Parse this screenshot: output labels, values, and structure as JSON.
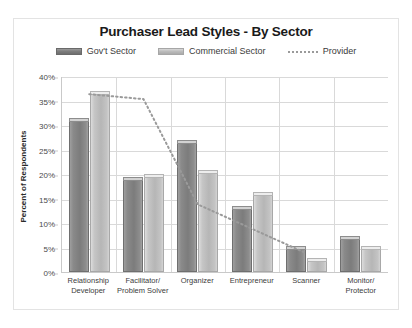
{
  "chart_data": {
    "type": "bar",
    "title": "Purchaser Lead Styles - By Sector",
    "xlabel": "",
    "ylabel": "Percent of Respondents",
    "ylim": [
      0,
      40
    ],
    "ytick_labels": [
      "40%",
      "35%",
      "30%",
      "25%",
      "20%",
      "15%",
      "10%",
      "5%",
      "0%"
    ],
    "ytick_values": [
      40,
      35,
      30,
      25,
      20,
      15,
      10,
      5,
      0
    ],
    "grid": true,
    "legend_position": "top-center",
    "categories": [
      "Relationship Developer",
      "Facilitator/ Problem Solver",
      "Organizer",
      "Entrepreneur",
      "Scanner",
      "Monitor/ Protector"
    ],
    "category_lines": [
      [
        "Relationship",
        "Developer"
      ],
      [
        "Facilitator/",
        "Problem Solver"
      ],
      [
        "Organizer",
        ""
      ],
      [
        "Entrepreneur",
        ""
      ],
      [
        "Scanner",
        ""
      ],
      [
        "Monitor/",
        "Protector"
      ]
    ],
    "series": [
      {
        "name": "Gov't Sector",
        "type": "bar",
        "color": "#7c7c7c",
        "values": [
          31,
          19,
          26.5,
          13,
          5,
          7
        ]
      },
      {
        "name": "Commercial Sector",
        "type": "bar",
        "color": "#b6b6b6",
        "values": [
          36.5,
          19.5,
          20.5,
          16,
          2.5,
          5
        ]
      },
      {
        "name": "Provider",
        "type": "line",
        "style": "dotted",
        "color": "#9a9a9a",
        "values": [
          36.5,
          35.5,
          14,
          9,
          4,
          null
        ]
      }
    ]
  },
  "legend": {
    "items": [
      {
        "label": "Gov't Sector",
        "swatch": "govt"
      },
      {
        "label": "Commercial Sector",
        "swatch": "commercial"
      },
      {
        "label": "Provider",
        "swatch": "provider"
      }
    ]
  },
  "colors": {
    "govt": "#7c7c7c",
    "commercial": "#b6b6b6",
    "provider": "#9a9a9a",
    "grid": "#d9d9d9",
    "axis": "#c9c9c9",
    "frame": "#e3e3e3"
  }
}
